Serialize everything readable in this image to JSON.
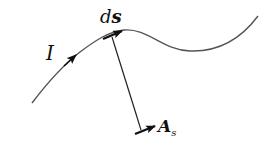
{
  "diagram": {
    "type": "current-element-vector-potential",
    "labels": {
      "current": "I",
      "element_prefix": "d",
      "element_vector": "s",
      "potential": "A",
      "potential_subscript": "s"
    },
    "colors": {
      "curve": "#555555",
      "arrows": "#111111",
      "background": "#ffffff"
    }
  }
}
